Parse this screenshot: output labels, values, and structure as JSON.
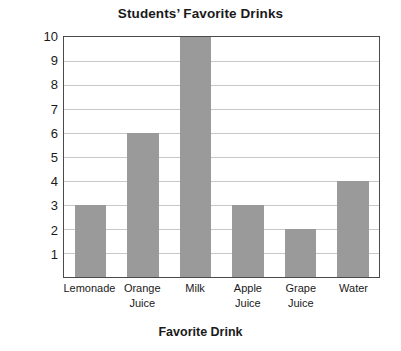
{
  "chart_data": {
    "type": "bar",
    "title": "Students’ Favorite Drinks",
    "xlabel": "Favorite Drink",
    "ylabel": "Number of Students",
    "categories": [
      "Lemonade",
      "Orange Juice",
      "Milk",
      "Apple Juice",
      "Grape Juice",
      "Water"
    ],
    "category_lines": [
      [
        "Lemonade"
      ],
      [
        "Orange",
        "Juice"
      ],
      [
        "Milk"
      ],
      [
        "Apple",
        "Juice"
      ],
      [
        "Grape",
        "Juice"
      ],
      [
        "Water"
      ]
    ],
    "values": [
      3,
      6,
      10,
      3,
      2,
      4
    ],
    "ylim": [
      0,
      10
    ],
    "ytick_labels": [
      "10",
      "9",
      "8",
      "7",
      "6",
      "5",
      "4",
      "3",
      "2",
      "1"
    ],
    "ytick_values": [
      10,
      9,
      8,
      7,
      6,
      5,
      4,
      3,
      2,
      1
    ],
    "grid": true,
    "legend": false,
    "colors": {
      "bar_fill": "#9a9a9a",
      "gridline": "#c8c8c8",
      "axis_border": "#4a4a4a",
      "background": "#ffffff",
      "text": "#1a1a1a"
    }
  }
}
